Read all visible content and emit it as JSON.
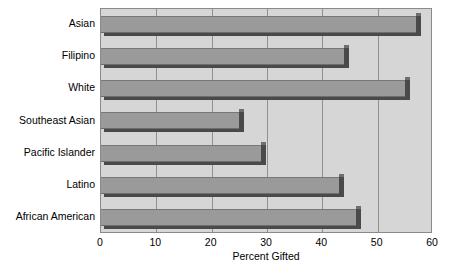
{
  "chart_data": {
    "type": "bar",
    "orientation": "horizontal",
    "title": "",
    "subtitle": "",
    "xlabel": "Percent Gifted",
    "ylabel": "",
    "categories": [
      "Asian",
      "Filipino",
      "White",
      "Southeast Asian",
      "Pacific Islander",
      "Latino",
      "African American"
    ],
    "values": [
      57,
      44,
      55,
      25,
      29,
      43,
      46
    ],
    "series": [
      {
        "name": "Percent Gifted",
        "values": [
          57,
          44,
          55,
          25,
          29,
          43,
          46
        ]
      }
    ],
    "xlim": [
      0,
      60
    ],
    "xticks": [
      0,
      10,
      20,
      30,
      40,
      50,
      60
    ],
    "xtick_labels": [
      "0",
      "10",
      "20",
      "30",
      "40",
      "50",
      "60"
    ],
    "grid": "vertical",
    "legend": "none",
    "colors": {
      "plot_background": "#d6d6d6",
      "bar_fill": "#9a9a9a",
      "bar_shadow": "#4a4a4a",
      "gridline": "#909090",
      "axis": "#8a8a8a",
      "text": "#000000",
      "page_background": "#ffffff"
    }
  }
}
